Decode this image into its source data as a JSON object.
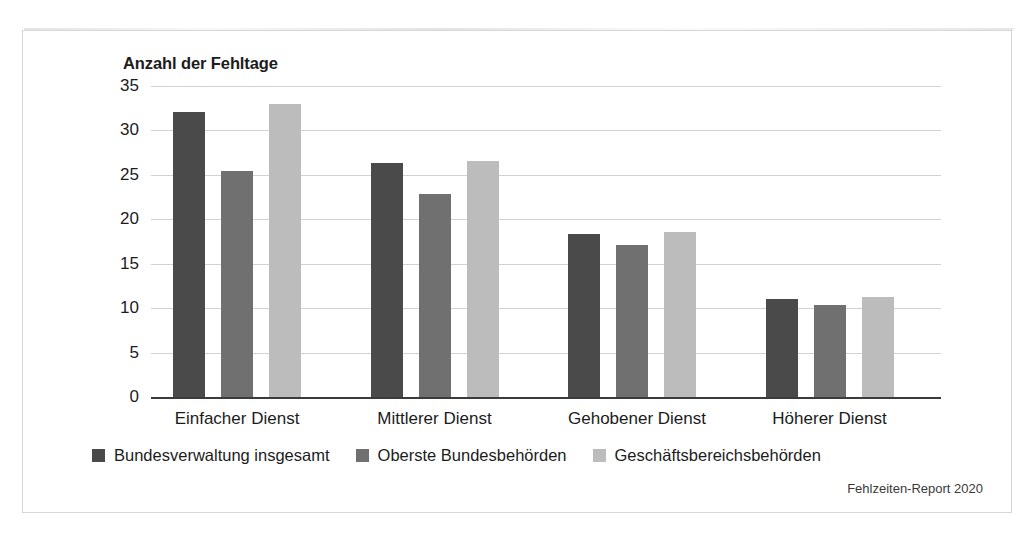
{
  "figure": {
    "source_note": "Fehlzeiten-Report 2020"
  },
  "chart_data": {
    "type": "bar",
    "title": "Anzahl der Fehltage",
    "xlabel": "",
    "ylabel": "Anzahl der Fehltage",
    "categories": [
      "Einfacher Dienst",
      "Mittlerer Dienst",
      "Gehobener Dienst",
      "Höherer Dienst"
    ],
    "series": [
      {
        "name": "Bundesverwaltung insgesamt",
        "color": "#4a4a4a",
        "values": [
          32.1,
          26.3,
          18.4,
          11.0
        ]
      },
      {
        "name": "Oberste Bundesbehörden",
        "color": "#707070",
        "values": [
          25.4,
          22.9,
          17.1,
          10.4
        ]
      },
      {
        "name": "Geschäftsbereichsbehörden",
        "color": "#bcbcbc",
        "values": [
          33.0,
          26.6,
          18.6,
          11.2
        ]
      }
    ],
    "ylim": [
      0,
      35
    ],
    "yticks": [
      35,
      30,
      25,
      20,
      15,
      10,
      5,
      0
    ],
    "grid": true,
    "legend_position": "bottom"
  }
}
